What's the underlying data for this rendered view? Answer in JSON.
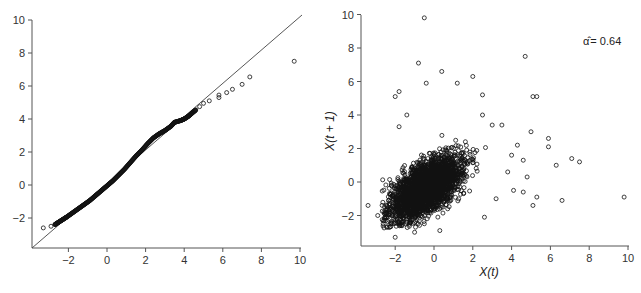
{
  "chart_data": [
    {
      "type": "scatter",
      "title": "",
      "xlabel": "",
      "ylabel": "",
      "xlim": [
        -3.9,
        10.1
      ],
      "ylim": [
        -3.8,
        10.2
      ],
      "xticks": [
        -2,
        0,
        2,
        4,
        6,
        8,
        10
      ],
      "yticks": [
        -2,
        0,
        2,
        4,
        6,
        8,
        10
      ],
      "tick_labels_x": [
        "−2",
        "0",
        "2",
        "4",
        "6",
        "8",
        "10"
      ],
      "tick_labels_y": [
        "−2",
        "0",
        "2",
        "4",
        "6",
        "8",
        "10"
      ],
      "grid": false,
      "reference_line": {
        "type": "identity",
        "from": [
          -3.9,
          -3.8
        ],
        "to": [
          10.2,
          10.2
        ]
      },
      "description": "Q-Q plot: dense curve of points closely following y=x from about -3 to 4, with tail points falling below the line",
      "series": [
        {
          "name": "qq-points",
          "points": [
            [
              -3.3,
              -2.6
            ],
            [
              -2.9,
              -2.5
            ],
            [
              -2.7,
              -2.4
            ],
            [
              -2.5,
              -2.25
            ],
            [
              -2.3,
              -2.1
            ],
            [
              -2.1,
              -1.95
            ],
            [
              -1.8,
              -1.7
            ],
            [
              -1.5,
              -1.45
            ],
            [
              -1.2,
              -1.2
            ],
            [
              -0.9,
              -0.95
            ],
            [
              -0.6,
              -0.65
            ],
            [
              -0.3,
              -0.35
            ],
            [
              0.0,
              -0.05
            ],
            [
              0.3,
              0.25
            ],
            [
              0.6,
              0.6
            ],
            [
              0.9,
              0.95
            ],
            [
              1.2,
              1.35
            ],
            [
              1.5,
              1.75
            ],
            [
              1.8,
              2.1
            ],
            [
              2.1,
              2.5
            ],
            [
              2.4,
              2.85
            ],
            [
              2.7,
              3.1
            ],
            [
              3.0,
              3.3
            ],
            [
              3.3,
              3.55
            ],
            [
              3.5,
              3.8
            ],
            [
              3.8,
              3.9
            ],
            [
              4.0,
              4.0
            ],
            [
              4.2,
              4.15
            ],
            [
              4.4,
              4.35
            ],
            [
              4.6,
              4.55
            ],
            [
              4.8,
              4.75
            ],
            [
              5.0,
              4.95
            ],
            [
              5.3,
              5.1
            ],
            [
              5.8,
              5.3
            ],
            [
              5.8,
              5.45
            ],
            [
              6.2,
              5.6
            ],
            [
              6.5,
              5.8
            ],
            [
              7.0,
              6.1
            ],
            [
              7.4,
              6.55
            ],
            [
              9.7,
              7.5
            ]
          ]
        }
      ]
    },
    {
      "type": "scatter",
      "title": "",
      "xlabel": "X(t)",
      "ylabel": "X(t + 1)",
      "xlim": [
        -3.9,
        10.1
      ],
      "ylim": [
        -3.8,
        10.2
      ],
      "xticks": [
        -2,
        0,
        2,
        4,
        6,
        8,
        10
      ],
      "yticks": [
        -2,
        0,
        2,
        4,
        6,
        8,
        10
      ],
      "tick_labels_x": [
        "−2",
        "0",
        "2",
        "4",
        "6",
        "8",
        "10"
      ],
      "tick_labels_y": [
        "−2",
        "0",
        "2",
        "4",
        "6",
        "8",
        "10"
      ],
      "grid": false,
      "annotation": "α̂ = 0.64",
      "description": "Lag plot: dense elliptical cloud centered near (0,0) elongated along positive slope, with sparse outliers",
      "outliers": [
        [
          -0.5,
          9.8
        ],
        [
          -0.8,
          7.1
        ],
        [
          0.4,
          6.6
        ],
        [
          2.0,
          6.3
        ],
        [
          -0.4,
          5.9
        ],
        [
          1.2,
          5.9
        ],
        [
          -2.0,
          5.1
        ],
        [
          -1.8,
          5.4
        ],
        [
          4.7,
          7.5
        ],
        [
          5.1,
          5.1
        ],
        [
          5.3,
          5.1
        ],
        [
          2.5,
          5.2
        ],
        [
          -1.8,
          3.3
        ],
        [
          -1.4,
          4.0
        ],
        [
          2.5,
          4.0
        ],
        [
          3.0,
          3.4
        ],
        [
          3.5,
          3.4
        ],
        [
          5.0,
          3.0
        ],
        [
          5.9,
          2.6
        ],
        [
          5.9,
          2.1
        ],
        [
          7.1,
          1.4
        ],
        [
          7.5,
          1.2
        ],
        [
          6.3,
          1.0
        ],
        [
          4.0,
          1.6
        ],
        [
          4.3,
          2.2
        ],
        [
          4.6,
          1.3
        ],
        [
          3.8,
          0.6
        ],
        [
          4.1,
          -0.5
        ],
        [
          4.8,
          0.3
        ],
        [
          4.6,
          -0.6
        ],
        [
          5.3,
          -0.9
        ],
        [
          5.1,
          -1.4
        ],
        [
          6.6,
          -1.1
        ],
        [
          9.8,
          -0.9
        ],
        [
          -3.4,
          -1.4
        ],
        [
          -2.0,
          -3.3
        ],
        [
          0.3,
          -2.9
        ],
        [
          -1.0,
          -3.0
        ],
        [
          2.6,
          -2.1
        ],
        [
          3.2,
          -1.0
        ],
        [
          -2.9,
          -2.0
        ]
      ],
      "cloud": {
        "center": [
          -0.5,
          -0.3
        ],
        "major_axis_slope": 0.64,
        "x_range": [
          -2.8,
          2.6
        ],
        "y_range": [
          -2.8,
          3.0
        ]
      }
    }
  ],
  "left_plot": {
    "xticks": [
      "−2",
      "0",
      "2",
      "4",
      "6",
      "8",
      "10"
    ],
    "yticks": [
      "−2",
      "0",
      "2",
      "4",
      "6",
      "8",
      "10"
    ]
  },
  "right_plot": {
    "xticks": [
      "−2",
      "0",
      "2",
      "4",
      "6",
      "8",
      "10"
    ],
    "yticks": [
      "−2",
      "0",
      "2",
      "4",
      "6",
      "8",
      "10"
    ],
    "xlabel": "X(t)",
    "ylabel": "X(t + 1)",
    "annotation_symbol": "α̂",
    "annotation_value": "= 0.64"
  }
}
